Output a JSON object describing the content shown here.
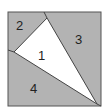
{
  "diagram": {
    "colors": {
      "shaded": "#b3b3b3",
      "unshaded": "#ffffff",
      "stroke": "#444444"
    },
    "regions": [
      {
        "id": "1",
        "label": "1",
        "shaded": false
      },
      {
        "id": "2",
        "label": "2",
        "shaded": true
      },
      {
        "id": "3",
        "label": "3",
        "shaded": true
      },
      {
        "id": "4",
        "label": "4",
        "shaded": true
      }
    ]
  }
}
